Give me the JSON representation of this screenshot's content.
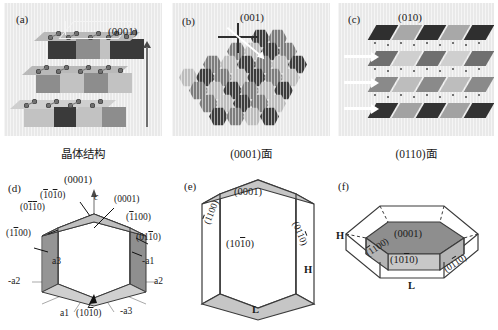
{
  "figure": {
    "background": "#ffffff",
    "panel_bg": "#e9e9e9"
  },
  "top_row": {
    "panels": [
      {
        "tag": "(a)",
        "index_label": "(0001)",
        "description": "layered crystal structure with stacked polyhedral slabs and interlayer atoms",
        "arrow": "vertical c-axis arrow"
      },
      {
        "tag": "(b)",
        "index_label": "(001)",
        "description": "hexagonal close packed surface tiling viewed along c"
      },
      {
        "tag": "(c)",
        "index_label": "(010)",
        "description": "edge-on stacked layers with white interlayer arrows"
      }
    ]
  },
  "captions": [
    {
      "text": "晶体结构"
    },
    {
      "text": "(0001)面"
    },
    {
      "text": "(0110)面"
    }
  ],
  "bottom_row": {
    "panel_d": {
      "tag": "(d)",
      "top_index": "(0001)",
      "c_axis": "c",
      "labels_left": [
        "(1̅0̅1̅0)",
        "(0̅1̅1̅0)",
        "(1̅1̅0̅0)"
      ],
      "labels_left_plain": [
        "(1010)",
        "(0110)",
        "(1100)"
      ],
      "labels_right": [
        "(0001)",
        "(1100)",
        "(0110)"
      ],
      "axes": [
        "a3",
        "-a1",
        "-a2",
        "a2",
        "a1",
        "-a3"
      ],
      "bottom_index": "(1010)"
    },
    "panel_e": {
      "tag": "(e)",
      "top_face": "(0001)",
      "front_face": "(1010)",
      "left_face": "(1100)",
      "right_face": "(0110)",
      "height_label": "H",
      "length_label": "L"
    },
    "panel_f": {
      "tag": "(f)",
      "top_face": "(0001)",
      "front_face": "(1010)",
      "left_face": "(1100)",
      "right_face": "(0110)",
      "height_label": "H",
      "length_label": "L"
    }
  }
}
